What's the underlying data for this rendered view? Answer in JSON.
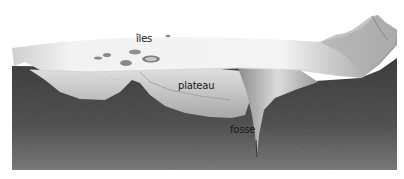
{
  "figure": {
    "style": "grayscale pencil illustration",
    "labels": {
      "islands": "îles",
      "plateau": "plateau",
      "trench": "fosse"
    }
  },
  "colors": {
    "background": "#ffffff",
    "seafloor_dark": "#4a4a4a",
    "seafloor_mid": "#6e6e6e",
    "surface_light": "#ececec",
    "slope_mid": "#b5b5b5",
    "label_text": "#1a1a1a"
  }
}
